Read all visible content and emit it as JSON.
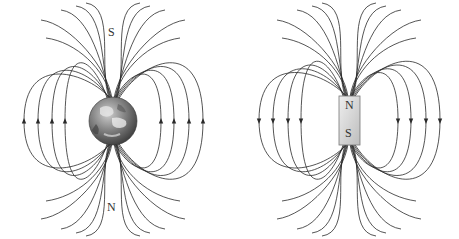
{
  "diagrams": [
    {
      "name": "earth-magnetic-field",
      "center": [
        113,
        121
      ],
      "earth_radius": 24,
      "labels": {
        "top": "S",
        "bottom": "N"
      },
      "arrow_direction": "up",
      "arrow_x_left": [
        24,
        38,
        52,
        65
      ],
      "arrow_x_right": [
        161,
        174,
        189,
        203
      ],
      "arrow_y": 122
    },
    {
      "name": "bar-magnet-magnetic-field",
      "center": [
        349,
        120
      ],
      "magnet": {
        "x": 339,
        "y": 96,
        "width": 21,
        "height": 49
      },
      "labels": {
        "top": "N",
        "bottom": "S"
      },
      "arrow_direction": "down",
      "arrow_x_left": [
        259,
        273,
        288,
        301
      ],
      "arrow_x_right": [
        398,
        411,
        426,
        440
      ],
      "arrow_y": 120
    }
  ],
  "colors": {
    "line": "#2a2a2a",
    "magnet": "#d8d8d8",
    "earth": "#6b6b6b"
  }
}
